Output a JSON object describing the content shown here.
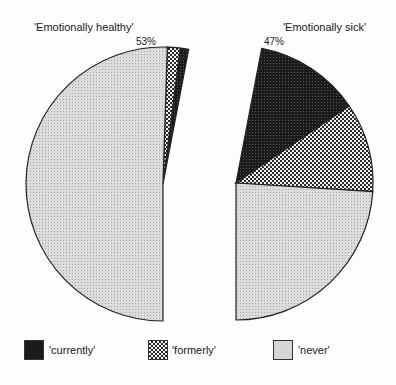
{
  "chart_data": {
    "type": "pie",
    "title": "",
    "pies": [
      {
        "name": "'Emotionally healthy'",
        "total_label": "53%",
        "total": 53,
        "slices": [
          {
            "label": "'currently'",
            "value": 1
          },
          {
            "label": "'formerly'",
            "value": 1.5
          },
          {
            "label": "'never'",
            "value": 50.5
          }
        ]
      },
      {
        "name": "'Emotionally sick'",
        "total_label": "47%",
        "total": 47,
        "slices": [
          {
            "label": "'currently'",
            "value": 12.5
          },
          {
            "label": "'formerly'",
            "value": 10.5
          },
          {
            "label": "'never'",
            "value": 24
          }
        ]
      }
    ],
    "legend": [
      "'currently'",
      "'formerly'",
      "'never'"
    ],
    "legend_position": "bottom"
  },
  "labels": {
    "left_title": "'Emotionally healthy'",
    "right_title": "'Emotionally sick'",
    "left_pct": "53%",
    "right_pct": "47%"
  },
  "legend": {
    "currently": "'currently'",
    "formerly": "'formerly'",
    "never": "'never'"
  },
  "colors": {
    "currently": "#1e1e1e",
    "formerly": "#7a7a7a",
    "never": "#d4d4d4"
  }
}
